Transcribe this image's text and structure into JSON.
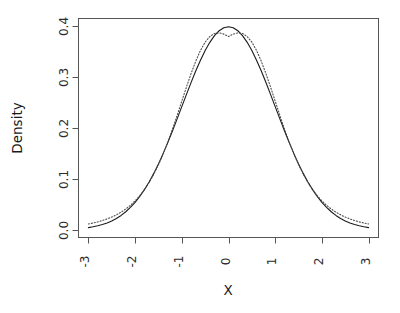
{
  "chart_data": {
    "type": "line",
    "title": "",
    "subtitle": "",
    "xlabel": "X",
    "ylabel": "Density",
    "xlim": [
      -3,
      3
    ],
    "ylim": [
      0.0,
      0.4
    ],
    "grid": false,
    "legend": null,
    "legend_position": "none",
    "xticks": [
      -3,
      -2,
      -1,
      0,
      1,
      2,
      3
    ],
    "xtick_labels": [
      "-3",
      "-2",
      "-1",
      "0",
      "1",
      "2",
      "3"
    ],
    "yticks": [
      0.0,
      0.1,
      0.2,
      0.3,
      0.4
    ],
    "ytick_labels": [
      "0.0",
      "0.1",
      "0.2",
      "0.3",
      "0.4"
    ],
    "annotations": [],
    "x": [
      -3.0,
      -2.9,
      -2.8,
      -2.7,
      -2.6,
      -2.5,
      -2.4,
      -2.3,
      -2.2,
      -2.1,
      -2.0,
      -1.9,
      -1.8,
      -1.7,
      -1.6,
      -1.5,
      -1.4,
      -1.3,
      -1.2,
      -1.1,
      -1.0,
      -0.9,
      -0.8,
      -0.7,
      -0.6,
      -0.5,
      -0.4,
      -0.3,
      -0.2,
      -0.1,
      0.0,
      0.1,
      0.2,
      0.3,
      0.4,
      0.5,
      0.6,
      0.7,
      0.8,
      0.9,
      1.0,
      1.1,
      1.2,
      1.3,
      1.4,
      1.5,
      1.6,
      1.7,
      1.8,
      1.9,
      2.0,
      2.1,
      2.2,
      2.3,
      2.4,
      2.5,
      2.6,
      2.7,
      2.8,
      2.9,
      3.0
    ],
    "series": [
      {
        "name": "normal-density",
        "style": "solid",
        "color": "#1a1a1a",
        "width": 1.1,
        "values": [
          0.0044,
          0.006,
          0.0079,
          0.0104,
          0.0136,
          0.0175,
          0.0224,
          0.0283,
          0.0355,
          0.044,
          0.054,
          0.0656,
          0.079,
          0.094,
          0.1109,
          0.1295,
          0.1497,
          0.1714,
          0.1942,
          0.2179,
          0.242,
          0.2661,
          0.2897,
          0.3123,
          0.3332,
          0.3521,
          0.3683,
          0.3814,
          0.391,
          0.397,
          0.3989,
          0.397,
          0.391,
          0.3814,
          0.3683,
          0.3521,
          0.3332,
          0.3123,
          0.2897,
          0.2661,
          0.242,
          0.2179,
          0.1942,
          0.1714,
          0.1497,
          0.1295,
          0.1109,
          0.094,
          0.079,
          0.0656,
          0.054,
          0.044,
          0.0355,
          0.0283,
          0.0224,
          0.0175,
          0.0136,
          0.0104,
          0.0079,
          0.006,
          0.0044
        ]
      },
      {
        "name": "t-density",
        "style": "dotted",
        "color": "#4d4d4d",
        "width": 1.1,
        "values": [
          0.0115,
          0.0134,
          0.0156,
          0.0183,
          0.0214,
          0.0251,
          0.0295,
          0.0347,
          0.0409,
          0.0482,
          0.0569,
          0.0671,
          0.0791,
          0.0931,
          0.1093,
          0.1279,
          0.1489,
          0.1722,
          0.1977,
          0.2247,
          0.2527,
          0.2806,
          0.3073,
          0.3316,
          0.3524,
          0.3686,
          0.3796,
          0.3857,
          0.3869,
          0.3844,
          0.3796,
          0.3844,
          0.3869,
          0.3857,
          0.3796,
          0.3686,
          0.3524,
          0.3316,
          0.3073,
          0.2806,
          0.2527,
          0.2247,
          0.1977,
          0.1722,
          0.1489,
          0.1279,
          0.1093,
          0.0931,
          0.0791,
          0.0671,
          0.0569,
          0.0482,
          0.0409,
          0.0347,
          0.0295,
          0.0251,
          0.0214,
          0.0183,
          0.0156,
          0.0134,
          0.0115
        ]
      }
    ]
  },
  "axes": {
    "x_label": "X",
    "y_label": "Density"
  }
}
